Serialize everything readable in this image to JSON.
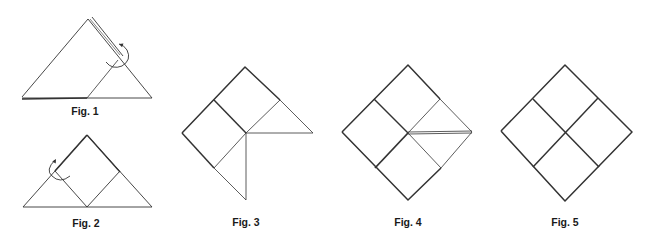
{
  "figures": [
    {
      "id": "fig1",
      "label": "Fig. 1",
      "label_pos": [
        85,
        105
      ],
      "lines": [
        {
          "pts": [
            [
              22,
              97
            ],
            [
              88,
              19
            ],
            [
              152,
              98
            ],
            [
              22,
              98
            ]
          ],
          "w": 0.9
        },
        {
          "pts": [
            [
              22,
              99
            ],
            [
              87,
              98
            ]
          ],
          "w": 1.6
        },
        {
          "pts": [
            [
              87,
              98
            ],
            [
              118,
              60
            ]
          ],
          "w": 0.8
        },
        {
          "pts": [
            [
              92,
              17
            ],
            [
              123,
              56
            ]
          ],
          "w": 0.9
        },
        {
          "pts": [
            [
              90,
              19
            ],
            [
              120,
              55
            ]
          ],
          "w": 0.6
        }
      ],
      "arcs": [
        {
          "d": "M 106 62 Q 112 70 122 66 Q 132 60 127 50 Q 123 44 119 44",
          "w": 0.9
        }
      ],
      "arrows": [
        {
          "at": [
            119,
            44
          ],
          "angle": 200
        }
      ]
    },
    {
      "id": "fig2",
      "label": "Fig. 2",
      "label_pos": [
        86,
        217
      ],
      "lines": [
        {
          "pts": [
            [
              23,
              207
            ],
            [
              87,
              135
            ],
            [
              152,
              207
            ],
            [
              23,
              207
            ]
          ],
          "w": 0.9
        },
        {
          "pts": [
            [
              87,
              135
            ],
            [
              55,
              171
            ]
          ],
          "w": 1.6
        },
        {
          "pts": [
            [
              87,
              135
            ],
            [
              120,
              172
            ]
          ],
          "w": 1.3
        },
        {
          "pts": [
            [
              55,
              171
            ],
            [
              87,
              207
            ],
            [
              120,
              171
            ]
          ],
          "w": 0.9
        }
      ],
      "arcs": [
        {
          "d": "M 55 160 Q 45 170 52 176 Q 60 184 70 176",
          "w": 0.9
        }
      ],
      "arrows": [
        {
          "at": [
            56,
            159
          ],
          "angle": -60
        }
      ]
    },
    {
      "id": "fig3",
      "label": "Fig. 3",
      "label_pos": [
        246,
        216
      ],
      "lines": [
        {
          "pts": [
            [
              182,
              133
            ],
            [
              245,
              67
            ],
            [
              280,
              100
            ]
          ],
          "w": 1.5
        },
        {
          "pts": [
            [
              182,
              133
            ],
            [
              214,
              168
            ]
          ],
          "w": 1.5
        },
        {
          "pts": [
            [
              214,
              100
            ],
            [
              246,
              133
            ]
          ],
          "w": 1.5
        },
        {
          "pts": [
            [
              280,
              100
            ],
            [
              313,
              133
            ],
            [
              246,
              133
            ]
          ],
          "w": 0.8
        },
        {
          "pts": [
            [
              246,
              133
            ],
            [
              280,
              100
            ]
          ],
          "w": 0.8
        },
        {
          "pts": [
            [
              246,
              133
            ],
            [
              214,
              168
            ]
          ],
          "w": 0.8
        },
        {
          "pts": [
            [
              214,
              168
            ],
            [
              246,
              200
            ],
            [
              246,
              133
            ]
          ],
          "w": 0.8
        }
      ],
      "arcs": [],
      "arrows": []
    },
    {
      "id": "fig4",
      "label": "Fig. 4",
      "label_pos": [
        408,
        216
      ],
      "lines": [
        {
          "pts": [
            [
              342,
              132
            ],
            [
              408,
              65
            ],
            [
              440,
              99
            ]
          ],
          "w": 1.5
        },
        {
          "pts": [
            [
              342,
              132
            ],
            [
              408,
              200
            ],
            [
              441,
              168
            ]
          ],
          "w": 1.5
        },
        {
          "pts": [
            [
              374,
              99
            ],
            [
              408,
              133
            ]
          ],
          "w": 1.5
        },
        {
          "pts": [
            [
              408,
              133
            ],
            [
              375,
              168
            ]
          ],
          "w": 1.8
        },
        {
          "pts": [
            [
              440,
              99
            ],
            [
              472,
              132
            ],
            [
              441,
              168
            ]
          ],
          "w": 0.8
        },
        {
          "pts": [
            [
              408,
              133
            ],
            [
              440,
              99
            ]
          ],
          "w": 0.8
        },
        {
          "pts": [
            [
              408,
              133
            ],
            [
              441,
              168
            ]
          ],
          "w": 0.8
        },
        {
          "pts": [
            [
              408,
              132
            ],
            [
              472,
              131
            ]
          ],
          "w": 0.8
        },
        {
          "pts": [
            [
              408,
              134
            ],
            [
              472,
              133
            ]
          ],
          "w": 0.8
        }
      ],
      "arcs": [],
      "arrows": []
    },
    {
      "id": "fig5",
      "label": "Fig. 5",
      "label_pos": [
        565,
        216
      ],
      "lines": [
        {
          "pts": [
            [
              501,
              131
            ],
            [
              565,
              65
            ],
            [
              632,
              132
            ],
            [
              565,
              201
            ],
            [
              501,
              131
            ]
          ],
          "w": 1.5
        },
        {
          "pts": [
            [
              533,
              99
            ],
            [
              599,
              167
            ]
          ],
          "w": 1.5
        },
        {
          "pts": [
            [
              598,
              98
            ],
            [
              533,
              167
            ]
          ],
          "w": 1.5
        }
      ],
      "arcs": [],
      "arrows": []
    }
  ],
  "colors": {
    "stroke": "#333333",
    "background": "#ffffff"
  }
}
